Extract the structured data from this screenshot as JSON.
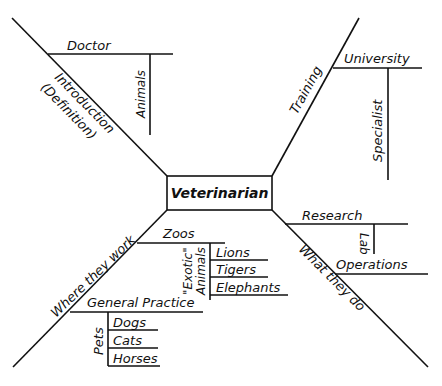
{
  "center": {
    "label": "Veterinarian"
  },
  "branches": {
    "introduction": {
      "label_line1": "Introduction",
      "label_line2": "(Definition)",
      "sub": {
        "label": "Doctor",
        "detail": "Animals"
      }
    },
    "training": {
      "label": "Training",
      "sub": {
        "label": "University",
        "detail": "Specialist"
      }
    },
    "where_they_work": {
      "label": "Where they work",
      "zoos": {
        "label": "Zoos",
        "group_line1": "\"Exotic\"",
        "group_line2": "Animals",
        "items": [
          "Lions",
          "Tigers",
          "Elephants"
        ]
      },
      "general_practice": {
        "label": "General Practice",
        "group": "Pets",
        "items": [
          "Dogs",
          "Cats",
          "Horses"
        ]
      }
    },
    "what_they_do": {
      "label": "What they do",
      "research": {
        "label": "Research",
        "detail": "Lab"
      },
      "operations": {
        "label": "Operations"
      }
    }
  },
  "colors": {
    "ink": "#111111",
    "background": "#ffffff"
  }
}
